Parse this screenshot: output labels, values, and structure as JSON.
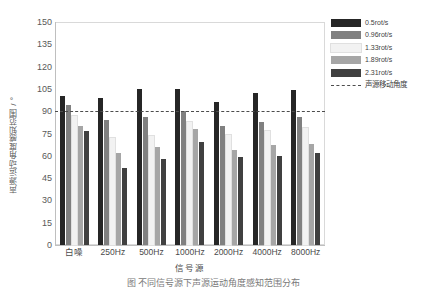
{
  "chart_data": {
    "type": "bar",
    "title": "",
    "xlabel": "信号源",
    "ylabel": "声源运动角度感知范围 / °",
    "ylim": [
      0,
      150
    ],
    "yticks": [
      150,
      135,
      120,
      105,
      90,
      75,
      60,
      45,
      30,
      15,
      0
    ],
    "grid": false,
    "legend_position": "right",
    "categories": [
      "白噪",
      "250Hz",
      "500Hz",
      "1000Hz",
      "2000Hz",
      "4000Hz",
      "8000Hz"
    ],
    "series": [
      {
        "name": "0.5rot/s",
        "color": "#262626",
        "values": [
          100,
          99,
          105,
          105,
          96,
          102,
          104
        ]
      },
      {
        "name": "0.96rot/s",
        "color": "#808080",
        "values": [
          94,
          84,
          86,
          90,
          80,
          83,
          86
        ]
      },
      {
        "name": "1.33rot/s",
        "color": "#F2F2F2",
        "values": [
          87,
          72,
          73,
          83,
          74,
          77,
          79
        ]
      },
      {
        "name": "1.89rot/s",
        "color": "#A6A6A6",
        "values": [
          80,
          62,
          66,
          78,
          64,
          67,
          68
        ]
      },
      {
        "name": "2.31rot/s",
        "color": "#404040",
        "values": [
          77,
          52,
          58,
          69,
          59,
          60,
          62
        ]
      }
    ],
    "annotations": [
      {
        "name": "声源移动角度",
        "type": "hline",
        "value": 90,
        "style": "dashed",
        "color": "#4d4d4d"
      }
    ]
  },
  "legend": {
    "items": [
      {
        "label": "0.5rot/s",
        "color": "#262626",
        "kind": "swatch"
      },
      {
        "label": "0.96rot/s",
        "color": "#808080",
        "kind": "swatch"
      },
      {
        "label": "1.33rot/s",
        "color": "#F2F2F2",
        "kind": "swatch"
      },
      {
        "label": "1.89rot/s",
        "color": "#A6A6A6",
        "kind": "swatch"
      },
      {
        "label": "2.31rot/s",
        "color": "#404040",
        "kind": "swatch"
      },
      {
        "label": "声源移动角度",
        "color": "#4d4d4d",
        "kind": "line"
      }
    ]
  },
  "caption": "图  不同信号源下声源运动角度感知范围分布"
}
